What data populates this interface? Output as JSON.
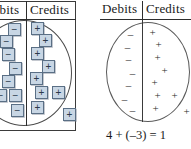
{
  "figure": {
    "equation": "4 + (–3) = 1"
  },
  "left_panel": {
    "headers": {
      "debits": "Debits",
      "credits": "Credits"
    },
    "debit_tiles": [
      {
        "symbol": "−",
        "x": 8,
        "y": 23
      },
      {
        "symbol": "−",
        "x": 0,
        "y": 35
      },
      {
        "symbol": "−",
        "x": 2,
        "y": 48
      },
      {
        "symbol": "−",
        "x": 9,
        "y": 62
      },
      {
        "symbol": "−",
        "x": 2,
        "y": 75
      },
      {
        "symbol": "−",
        "x": -6,
        "y": 89
      },
      {
        "symbol": "−",
        "x": 9,
        "y": 89
      },
      {
        "symbol": "−",
        "x": 11,
        "y": 104
      }
    ],
    "credit_tiles": [
      {
        "symbol": "+",
        "x": 31,
        "y": 22
      },
      {
        "symbol": "+",
        "x": 39,
        "y": 34
      },
      {
        "symbol": "+",
        "x": 31,
        "y": 47
      },
      {
        "symbol": "+",
        "x": 42,
        "y": 60
      },
      {
        "symbol": "+",
        "x": 30,
        "y": 72
      },
      {
        "symbol": "+",
        "x": 35,
        "y": 86
      },
      {
        "symbol": "+",
        "x": 52,
        "y": 86
      },
      {
        "symbol": "+",
        "x": 31,
        "y": 101
      },
      {
        "symbol": "+",
        "x": 63,
        "y": 108
      }
    ]
  },
  "right_panel": {
    "headers": {
      "debits": "Debits",
      "credits": "Credits"
    },
    "debit_signs": [
      {
        "symbol": "–",
        "x": 28,
        "y": 29
      },
      {
        "symbol": "–",
        "x": 25,
        "y": 42
      },
      {
        "symbol": "–",
        "x": 26,
        "y": 54
      },
      {
        "symbol": "–",
        "x": 30,
        "y": 68
      },
      {
        "symbol": "–",
        "x": 26,
        "y": 80
      },
      {
        "symbol": "–",
        "x": 22,
        "y": 94
      },
      {
        "symbol": "–",
        "x": 30,
        "y": 105
      }
    ],
    "credit_signs": [
      {
        "symbol": "+",
        "x": 50,
        "y": 27
      },
      {
        "symbol": "+",
        "x": 56,
        "y": 39
      },
      {
        "symbol": "+",
        "x": 55,
        "y": 52
      },
      {
        "symbol": "+",
        "x": 62,
        "y": 65
      },
      {
        "symbol": "+",
        "x": 52,
        "y": 77
      },
      {
        "symbol": "+",
        "x": 55,
        "y": 90
      },
      {
        "symbol": "+",
        "x": 72,
        "y": 90
      },
      {
        "symbol": "+",
        "x": 53,
        "y": 103
      },
      {
        "symbol": "+",
        "x": 84,
        "y": 106
      }
    ]
  },
  "colors": {
    "tile_fill": "#c8d6e4",
    "tile_border": "#5a6f85",
    "ink": "#2b2b2b",
    "rule": "#2d2d2d"
  }
}
